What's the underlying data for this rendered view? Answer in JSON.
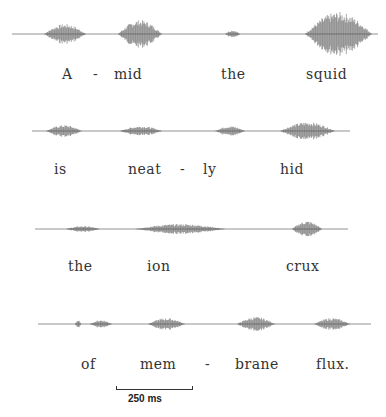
{
  "figure": {
    "lines": [
      {
        "words": [
          {
            "text": "A",
            "x": 62
          },
          {
            "text": "-",
            "x": 93
          },
          {
            "text": "mid",
            "x": 114
          },
          {
            "text": "the",
            "x": 221
          },
          {
            "text": "squid",
            "x": 306
          }
        ],
        "label_y": 67,
        "wave": {
          "y": 34,
          "x_start": 12,
          "x_end": 378,
          "bursts": [
            [
              44,
              86,
              10
            ],
            [
              118,
              162,
              14
            ],
            [
              225,
              240,
              4
            ],
            [
              305,
              372,
              22
            ]
          ]
        }
      },
      {
        "words": [
          {
            "text": "is",
            "x": 54
          },
          {
            "text": "neat",
            "x": 128
          },
          {
            "text": "-",
            "x": 180
          },
          {
            "text": "ly",
            "x": 203
          },
          {
            "text": "hid",
            "x": 280
          }
        ],
        "label_y": 162,
        "wave": {
          "y": 131,
          "x_start": 32,
          "x_end": 350,
          "bursts": [
            [
              46,
              82,
              6
            ],
            [
              120,
              162,
              5
            ],
            [
              215,
              245,
              5
            ],
            [
              280,
              335,
              9
            ]
          ]
        }
      },
      {
        "words": [
          {
            "text": "the",
            "x": 68
          },
          {
            "text": "ion",
            "x": 147
          },
          {
            "text": "crux",
            "x": 286
          }
        ],
        "label_y": 259,
        "wave": {
          "y": 229,
          "x_start": 35,
          "x_end": 348,
          "bursts": [
            [
              66,
              100,
              3
            ],
            [
              135,
              225,
              5
            ],
            [
              292,
              322,
              8
            ]
          ]
        }
      },
      {
        "words": [
          {
            "text": "of",
            "x": 81
          },
          {
            "text": "mem",
            "x": 140
          },
          {
            "text": "-",
            "x": 205
          },
          {
            "text": "brane",
            "x": 235
          },
          {
            "text": "flux.",
            "x": 316
          }
        ],
        "label_y": 357,
        "wave": {
          "y": 324,
          "x_start": 38,
          "x_end": 371,
          "bursts": [
            [
              75,
              81,
              4
            ],
            [
              90,
              112,
              4
            ],
            [
              148,
              185,
              6
            ],
            [
              237,
              275,
              7
            ],
            [
              314,
              350,
              6
            ]
          ]
        }
      }
    ],
    "scale_bar": {
      "label": "250 ms"
    }
  }
}
